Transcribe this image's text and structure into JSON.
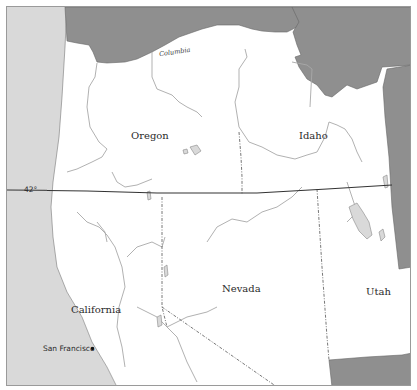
{
  "map": {
    "colors": {
      "ocean": "#d9d9d9",
      "land": "#ffffff",
      "outside_region": "#8f8f8f",
      "border": "#555555",
      "river": "#a8a8a8",
      "parallel_line": "#333333",
      "frame": "#9a9a9a"
    },
    "states": [
      {
        "name": "Oregon"
      },
      {
        "name": "Idaho"
      },
      {
        "name": "California"
      },
      {
        "name": "Nevada"
      },
      {
        "name": "Utah"
      }
    ],
    "rivers": [
      {
        "name": "Columbia"
      }
    ],
    "cities": [
      {
        "name": "San Francisco"
      }
    ],
    "parallels": [
      {
        "label": "42°"
      }
    ]
  }
}
